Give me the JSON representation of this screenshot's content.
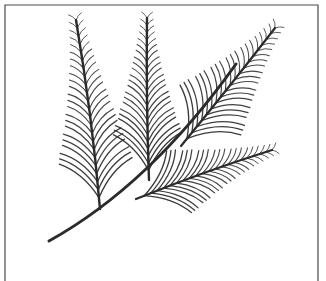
{
  "image": {
    "kind": "botanical-line-drawing",
    "subject": "pinnate conifer branch with four fronds",
    "style": "black ink line art on white background",
    "width": 326,
    "height": 281,
    "background_color": "#ffffff",
    "ink_color": "#2b2b2b",
    "border": {
      "visible": true,
      "color": "#4a4a4a",
      "inset_left": 5,
      "inset_top": 5,
      "inset_right": 8,
      "bottom_open": true,
      "stroke_width": 1.2
    }
  },
  "drawing": {
    "main_stem": {
      "name": "main-stem",
      "start": [
        49,
        241
      ],
      "end": [
        236,
        64
      ],
      "stroke_width": 3.0,
      "control": [
        150,
        185
      ]
    },
    "fronds": [
      {
        "id": "frond-left",
        "label": "left upright frond",
        "base": [
          100,
          209
        ],
        "tip": [
          76,
          20
        ],
        "rachis_control": [
          92,
          115
        ],
        "stroke_width": 2.4,
        "needle_count": 23,
        "needle_length_max": 52,
        "needle_length_min": 9,
        "needle_angle_deg": 46,
        "sweep": "upward"
      },
      {
        "id": "frond-middle",
        "label": "center upright frond",
        "base": [
          149,
          180
        ],
        "tip": [
          147,
          18
        ],
        "rachis_control": [
          146,
          100
        ],
        "stroke_width": 2.4,
        "needle_count": 22,
        "needle_length_max": 50,
        "needle_length_min": 8,
        "needle_angle_deg": 44,
        "sweep": "upward"
      },
      {
        "id": "frond-upper-right",
        "label": "upper right diagonal frond",
        "base": [
          181,
          146
        ],
        "tip": [
          275,
          28
        ],
        "rachis_control": [
          231,
          85
        ],
        "stroke_width": 2.2,
        "needle_count": 20,
        "needle_length_max": 54,
        "needle_length_min": 9,
        "needle_angle_deg": 48,
        "sweep": "outward"
      },
      {
        "id": "frond-lower-right",
        "label": "lower right diagonal frond",
        "base": [
          136,
          199
        ],
        "tip": [
          272,
          150
        ],
        "rachis_control": [
          205,
          171
        ],
        "stroke_width": 2.2,
        "needle_count": 21,
        "needle_length_max": 50,
        "needle_length_min": 8,
        "needle_angle_deg": 43,
        "sweep": "outward"
      }
    ]
  }
}
